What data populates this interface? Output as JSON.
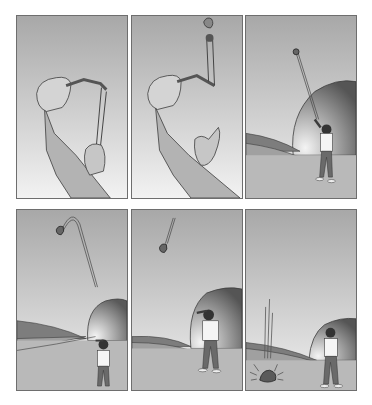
{
  "figure": {
    "layout": {
      "rows": 2,
      "columns": 3
    },
    "colors": {
      "sky_top": "#a9a9a9",
      "sky_bottom": "#f0f0f0",
      "ground": "#b9b9b9",
      "far_hill": "#7d7d7d",
      "near_hill": "#a0a0a0",
      "rock_dark": "#4a4a4a",
      "skin": "#b3b3b3",
      "outline": "#3c3c3c",
      "shirt": "#f5f5f5",
      "pants": "#6a6a6a"
    },
    "panels": [
      {
        "id": 1,
        "caption": "Arm holding a slingshot, elastic pulled back"
      },
      {
        "id": 2,
        "caption": "Slingshot released, projectile launched upward"
      },
      {
        "id": 3,
        "caption": "Man fires slingshot skyward beside a large rock"
      },
      {
        "id": 4,
        "caption": "Projectile arcs over and starts falling back"
      },
      {
        "id": 5,
        "caption": "Man shades eyes watching the projectile fall"
      },
      {
        "id": 6,
        "caption": "Projectile crashes to ground near the man"
      }
    ]
  }
}
